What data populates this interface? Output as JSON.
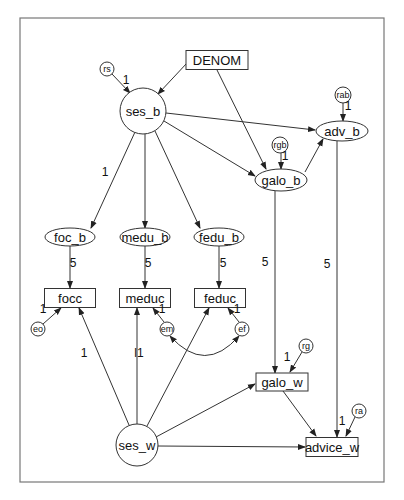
{
  "diagram": {
    "type": "structural-equation-path-diagram",
    "frame": {
      "x": 20,
      "y": 18,
      "w": 364,
      "h": 464
    },
    "colors": {
      "stroke": "#333333",
      "frame": "#777777",
      "text": "#111111",
      "background": "#ffffff"
    },
    "nodes": {
      "DENOM": {
        "label": "DENOM",
        "shape": "rect",
        "cx": 217,
        "cy": 60,
        "w": 62,
        "h": 19
      },
      "ses_b": {
        "label": "ses_b",
        "shape": "circle",
        "cx": 143,
        "cy": 111,
        "r": 23
      },
      "adv_b": {
        "label": "adv_b",
        "shape": "ellipse",
        "cx": 342,
        "cy": 131,
        "rx": 26,
        "ry": 10
      },
      "galo_b": {
        "label": "galo_b",
        "shape": "ellipse",
        "cx": 281,
        "cy": 180,
        "rx": 26,
        "ry": 11
      },
      "foc_b": {
        "label": "foc_b",
        "shape": "ellipse",
        "cx": 70,
        "cy": 237,
        "rx": 25,
        "ry": 9
      },
      "medu_b": {
        "label": "medu_b",
        "shape": "ellipse",
        "cx": 145,
        "cy": 237,
        "rx": 25,
        "ry": 9
      },
      "fedu_b": {
        "label": "fedu_b",
        "shape": "ellipse",
        "cx": 219,
        "cy": 237,
        "rx": 25,
        "ry": 9
      },
      "focc": {
        "label": "focc",
        "shape": "rect",
        "cx": 70,
        "cy": 298,
        "w": 51,
        "h": 19
      },
      "meduc": {
        "label": "meduc",
        "shape": "rect",
        "cx": 145,
        "cy": 298,
        "w": 51,
        "h": 19
      },
      "feduc": {
        "label": "feduc",
        "shape": "rect",
        "cx": 220,
        "cy": 298,
        "w": 51,
        "h": 19
      },
      "galo_w": {
        "label": "galo_w",
        "shape": "rect",
        "cx": 282,
        "cy": 382,
        "w": 52,
        "h": 18
      },
      "advice_w": {
        "label": "advice_w",
        "shape": "rect",
        "cx": 332,
        "cy": 447,
        "w": 52,
        "h": 19
      },
      "ses_w": {
        "label": "ses_w",
        "shape": "circle",
        "cx": 137,
        "cy": 445,
        "r": 21
      }
    },
    "error_terms": {
      "rs": {
        "label": "rs",
        "cx": 107,
        "cy": 69,
        "r": 7
      },
      "rab": {
        "label": "rab",
        "cx": 343,
        "cy": 95,
        "r": 8
      },
      "rgb": {
        "label": "rgb",
        "cx": 280,
        "cy": 145,
        "r": 8
      },
      "eo": {
        "label": "eo",
        "cx": 38,
        "cy": 329,
        "r": 7
      },
      "em": {
        "label": "em",
        "cx": 167,
        "cy": 329,
        "r": 7
      },
      "ef": {
        "label": "ef",
        "cx": 242,
        "cy": 329,
        "r": 7
      },
      "rg": {
        "label": "rg",
        "cx": 306,
        "cy": 346,
        "r": 7
      },
      "ra": {
        "label": "ra",
        "cx": 359,
        "cy": 411,
        "r": 7
      }
    },
    "path_labels": [
      {
        "id": "rs_ses_b",
        "text": "1",
        "x": 126,
        "y": 84
      },
      {
        "id": "rab_adv_b",
        "text": "1",
        "x": 348,
        "y": 110
      },
      {
        "id": "rgb_galo_b",
        "text": "1",
        "x": 285,
        "y": 160
      },
      {
        "id": "ses_b_foc_b",
        "text": "1",
        "x": 105,
        "y": 176
      },
      {
        "id": "foc_b_focc",
        "text": "5",
        "x": 73,
        "y": 267
      },
      {
        "id": "medu_b_meduc",
        "text": "5",
        "x": 148,
        "y": 267
      },
      {
        "id": "fedu_b_feduc",
        "text": "5",
        "x": 223,
        "y": 267
      },
      {
        "id": "galo_b_galo_w",
        "text": "5",
        "x": 265,
        "y": 266
      },
      {
        "id": "adv_b_advice_w",
        "text": "5",
        "x": 327,
        "y": 268
      },
      {
        "id": "eo_focc",
        "text": "1",
        "x": 43,
        "y": 313
      },
      {
        "id": "em_meduc",
        "text": "1",
        "x": 162,
        "y": 313
      },
      {
        "id": "ef_feduc",
        "text": "1",
        "x": 237,
        "y": 313
      },
      {
        "id": "ses_w_focc",
        "text": "1",
        "x": 84,
        "y": 357
      },
      {
        "id": "ses_w_meduc",
        "text": "l1",
        "x": 139,
        "y": 357
      },
      {
        "id": "rg_galo_w",
        "text": "1",
        "x": 287,
        "y": 361
      },
      {
        "id": "ra_advice_w",
        "text": "1",
        "x": 342,
        "y": 425
      }
    ],
    "edges": [
      {
        "from": "rs",
        "to": "ses_b",
        "x1": 112,
        "y1": 74,
        "x2": 130,
        "y2": 93
      },
      {
        "from": "DENOM",
        "to": "ses_b",
        "x1": 187,
        "y1": 63,
        "x2": 158,
        "y2": 94
      },
      {
        "from": "DENOM",
        "to": "galo_b",
        "x1": 217,
        "y1": 70,
        "x2": 266,
        "y2": 169
      },
      {
        "from": "ses_b",
        "to": "adv_b",
        "x1": 166,
        "y1": 113,
        "x2": 315,
        "y2": 130
      },
      {
        "from": "ses_b",
        "to": "galo_b",
        "x1": 164,
        "y1": 121,
        "x2": 255,
        "y2": 176
      },
      {
        "from": "ses_b",
        "to": "foc_b",
        "x1": 135,
        "y1": 132,
        "x2": 91,
        "y2": 228
      },
      {
        "from": "ses_b",
        "to": "medu_b",
        "x1": 145,
        "y1": 134,
        "x2": 145,
        "y2": 228
      },
      {
        "from": "ses_b",
        "to": "fedu_b",
        "x1": 155,
        "y1": 131,
        "x2": 200,
        "y2": 228
      },
      {
        "from": "rab",
        "to": "adv_b",
        "x1": 343,
        "y1": 103,
        "x2": 343,
        "y2": 121
      },
      {
        "from": "rgb",
        "to": "galo_b",
        "x1": 281,
        "y1": 153,
        "x2": 281,
        "y2": 169
      },
      {
        "from": "galo_b",
        "to": "adv_b",
        "x1": 305,
        "y1": 172,
        "x2": 323,
        "y2": 139
      },
      {
        "from": "foc_b",
        "to": "focc",
        "x1": 70,
        "y1": 246,
        "x2": 70,
        "y2": 288
      },
      {
        "from": "medu_b",
        "to": "meduc",
        "x1": 145,
        "y1": 246,
        "x2": 145,
        "y2": 288
      },
      {
        "from": "fedu_b",
        "to": "feduc",
        "x1": 219,
        "y1": 246,
        "x2": 219,
        "y2": 288
      },
      {
        "from": "galo_b",
        "to": "galo_w",
        "x1": 275,
        "y1": 191,
        "x2": 275,
        "y2": 373
      },
      {
        "from": "adv_b",
        "to": "advice_w",
        "x1": 337,
        "y1": 141,
        "x2": 337,
        "y2": 437
      },
      {
        "from": "eo",
        "to": "focc",
        "x1": 43,
        "y1": 324,
        "x2": 61,
        "y2": 308
      },
      {
        "from": "em",
        "to": "meduc",
        "x1": 164,
        "y1": 322,
        "x2": 153,
        "y2": 308
      },
      {
        "from": "ef",
        "to": "feduc",
        "x1": 239,
        "y1": 322,
        "x2": 228,
        "y2": 308
      },
      {
        "from": "ses_w",
        "to": "focc",
        "x1": 129,
        "y1": 425,
        "x2": 79,
        "y2": 308
      },
      {
        "from": "ses_w",
        "to": "meduc",
        "x1": 137,
        "y1": 424,
        "x2": 137,
        "y2": 308
      },
      {
        "from": "ses_w",
        "to": "feduc",
        "x1": 147,
        "y1": 426,
        "x2": 209,
        "y2": 308
      },
      {
        "from": "ses_w",
        "to": "galo_w",
        "x1": 156,
        "y1": 437,
        "x2": 255,
        "y2": 384
      },
      {
        "from": "ses_w",
        "to": "advice_w",
        "x1": 158,
        "y1": 446,
        "x2": 305,
        "y2": 447
      },
      {
        "from": "rg",
        "to": "galo_w",
        "x1": 302,
        "y1": 352,
        "x2": 290,
        "y2": 372
      },
      {
        "from": "galo_w",
        "to": "advice_w",
        "x1": 283,
        "y1": 391,
        "x2": 316,
        "y2": 436
      },
      {
        "from": "ra",
        "to": "advice_w",
        "x1": 355,
        "y1": 417,
        "x2": 346,
        "y2": 436
      }
    ],
    "covariances": [
      {
        "between": [
          "em",
          "ef"
        ],
        "path": "M 170 336 Q 205 375 239 336"
      }
    ]
  }
}
